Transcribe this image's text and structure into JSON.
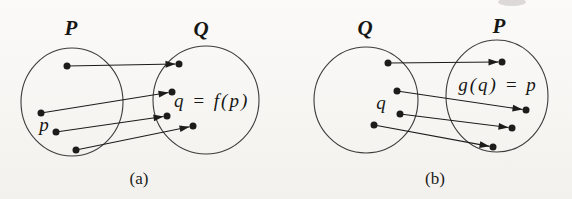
{
  "page": {
    "background_top": "#fbfaf8",
    "background_bottom": "#f3f1ee",
    "ink_color": "#1d1c1a",
    "outline_color": "#3d3c3a",
    "artifact_color": "#b5b2ae"
  },
  "figure": {
    "diagrams": [
      {
        "id": "a",
        "caption": "(a)",
        "caption_pos": [
          139,
          184
        ],
        "sets": [
          {
            "label": "P",
            "label_pos": [
              71,
              35
            ],
            "cx": 72,
            "cy": 102,
            "rx": 51,
            "ry": 54
          },
          {
            "label": "Q",
            "label_pos": [
              201,
              36
            ],
            "cx": 206,
            "cy": 100,
            "rx": 53,
            "ry": 54
          }
        ],
        "points": [
          [
            67,
            66
          ],
          [
            41,
            113
          ],
          [
            56,
            132
          ],
          [
            76,
            150
          ],
          [
            179,
            64
          ],
          [
            172,
            92
          ],
          [
            167,
            116
          ],
          [
            193,
            126
          ]
        ],
        "arrows": [
          {
            "from": [
              67,
              66
            ],
            "to": [
              179,
              64
            ]
          },
          {
            "from": [
              41,
              113
            ],
            "to": [
              172,
              92
            ]
          },
          {
            "from": [
              56,
              132
            ],
            "to": [
              167,
              116
            ]
          },
          {
            "from": [
              76,
              150
            ],
            "to": [
              193,
              126
            ]
          }
        ],
        "labels": [
          {
            "text": "p",
            "pos": [
              44,
              131
            ],
            "anchor": "middle",
            "class": "var-label"
          },
          {
            "text": "q = f(p)",
            "pos": [
              174,
              107
            ],
            "anchor": "start",
            "class": "expr-label"
          }
        ]
      },
      {
        "id": "b",
        "caption": "(b)",
        "caption_pos": [
          435,
          184
        ],
        "sets": [
          {
            "label": "Q",
            "label_pos": [
              365,
              35
            ],
            "cx": 366,
            "cy": 100,
            "rx": 52,
            "ry": 53
          },
          {
            "label": "P",
            "label_pos": [
              499,
              33
            ],
            "cx": 497,
            "cy": 96,
            "rx": 51,
            "ry": 56
          }
        ],
        "points": [
          [
            388,
            63
          ],
          [
            397,
            91
          ],
          [
            400,
            114
          ],
          [
            374,
            125
          ],
          [
            502,
            62
          ],
          [
            526,
            110
          ],
          [
            512,
            128
          ],
          [
            493,
            147
          ]
        ],
        "arrows": [
          {
            "from": [
              388,
              63
            ],
            "to": [
              502,
              62
            ]
          },
          {
            "from": [
              397,
              91
            ],
            "to": [
              526,
              110
            ]
          },
          {
            "from": [
              400,
              114
            ],
            "to": [
              512,
              128
            ]
          },
          {
            "from": [
              374,
              125
            ],
            "to": [
              493,
              147
            ]
          }
        ],
        "labels": [
          {
            "text": "q",
            "pos": [
              381,
              109
            ],
            "anchor": "middle",
            "class": "var-label"
          },
          {
            "text": "g(q) = p",
            "pos": [
              498,
              91
            ],
            "anchor": "middle",
            "class": "expr-label"
          }
        ]
      }
    ],
    "artifact": {
      "cx": 512,
      "cy": 2,
      "rx": 14,
      "ry": 4,
      "opacity": 0.45
    },
    "dot_radius": 3.5,
    "arrowhead": {
      "length": 10,
      "half_width": 3.4
    }
  }
}
